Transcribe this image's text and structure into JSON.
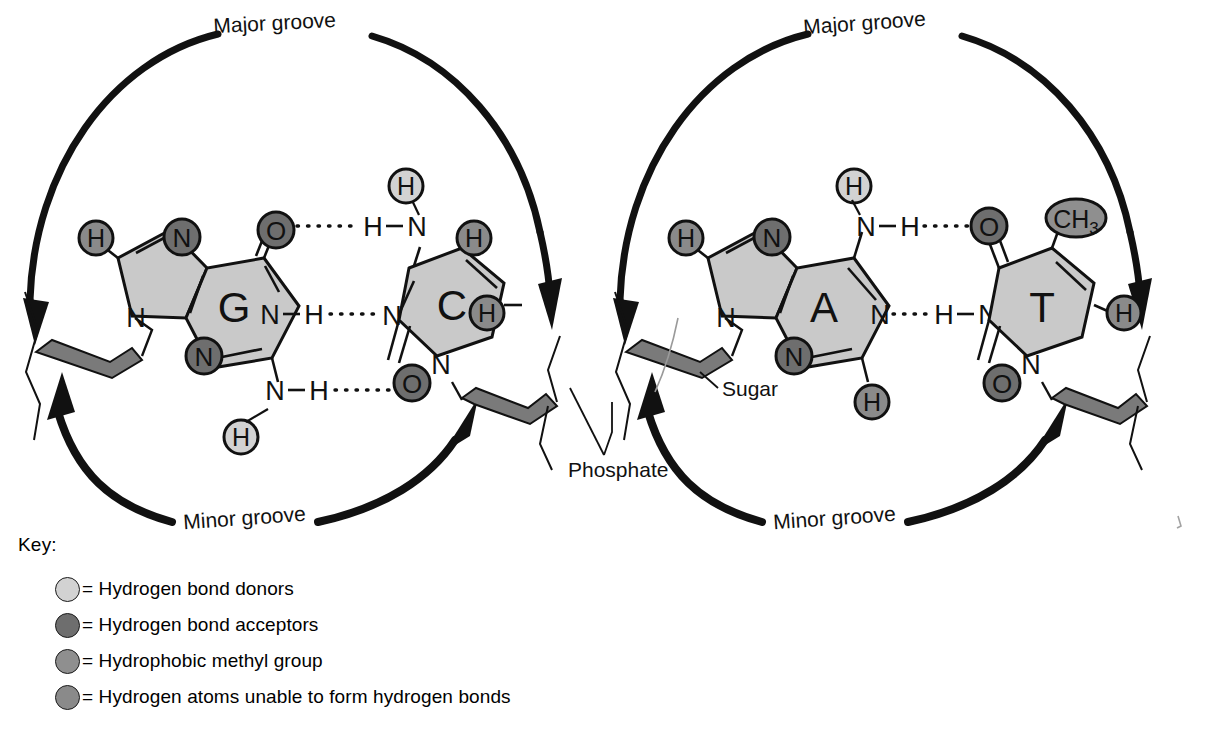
{
  "diagram": {
    "groove_labels": {
      "major": "Major groove",
      "minor": "Minor groove"
    },
    "backbone_labels": {
      "sugar": "Sugar",
      "phosphate": "Phosphate"
    },
    "colors": {
      "ring_fill": "#c9c9c9",
      "donor": "#d2d2d2",
      "acceptor": "#6e6e6e",
      "methyl": "#8f8f8f",
      "hydrogen_nonbonding": "#8a8a8a",
      "backbone_ribbon": "#7a7a7a",
      "stroke": "#111111",
      "background": "#ffffff"
    },
    "pairs": [
      {
        "id": "gc",
        "name": "guanine-cytosine",
        "purine": {
          "letter": "G",
          "name": "guanine",
          "atoms": [
            {
              "label": "H",
              "role": "hydrogen_nonbonding"
            },
            {
              "label": "N",
              "role": "acceptor"
            },
            {
              "label": "O",
              "role": "acceptor"
            },
            {
              "label": "N",
              "role": "acceptor"
            },
            {
              "label": "N",
              "role": "plain"
            },
            {
              "label": "N",
              "role": "plain"
            },
            {
              "label": "N",
              "role": "plain"
            },
            {
              "label": "H",
              "role": "donor"
            }
          ]
        },
        "pyrimidine": {
          "letter": "C",
          "name": "cytosine",
          "atoms": [
            {
              "label": "H",
              "role": "donor"
            },
            {
              "label": "H",
              "role": "hydrogen_nonbonding"
            },
            {
              "label": "H",
              "role": "hydrogen_nonbonding"
            },
            {
              "label": "O",
              "role": "acceptor"
            },
            {
              "label": "N",
              "role": "plain"
            },
            {
              "label": "N",
              "role": "plain"
            },
            {
              "label": "N",
              "role": "plain"
            }
          ]
        },
        "hydrogen_bonds": 3
      },
      {
        "id": "at",
        "name": "adenine-thymine",
        "purine": {
          "letter": "A",
          "name": "adenine",
          "atoms": [
            {
              "label": "H",
              "role": "hydrogen_nonbonding"
            },
            {
              "label": "N",
              "role": "acceptor"
            },
            {
              "label": "N",
              "role": "acceptor"
            },
            {
              "label": "H",
              "role": "hydrogen_nonbonding"
            },
            {
              "label": "H",
              "role": "donor"
            },
            {
              "label": "N",
              "role": "plain"
            },
            {
              "label": "N",
              "role": "plain"
            },
            {
              "label": "N",
              "role": "plain"
            }
          ]
        },
        "pyrimidine": {
          "letter": "T",
          "name": "thymine",
          "atoms": [
            {
              "label": "O",
              "role": "acceptor"
            },
            {
              "label": "O",
              "role": "acceptor"
            },
            {
              "label": "CH3",
              "role": "methyl"
            },
            {
              "label": "H",
              "role": "hydrogen_nonbonding"
            },
            {
              "label": "N",
              "role": "plain"
            },
            {
              "label": "N",
              "role": "plain"
            }
          ]
        },
        "hydrogen_bonds": 2
      }
    ],
    "atom_glyphs": {
      "h": "H",
      "n": "N",
      "o": "O",
      "methyl": "CH",
      "methyl_sub": "3",
      "bond_dash": "·",
      "bond_line": "–"
    }
  },
  "key": {
    "title": "Key:",
    "items": [
      {
        "swatch": "donor",
        "label": "= Hydrogen bond donors"
      },
      {
        "swatch": "acceptor",
        "label": "= Hydrogen bond acceptors"
      },
      {
        "swatch": "methyl",
        "label": "= Hydrophobic methyl group"
      },
      {
        "swatch": "hydrogen_nonbonding",
        "label": "= Hydrogen atoms unable to form hydrogen bonds"
      }
    ]
  }
}
